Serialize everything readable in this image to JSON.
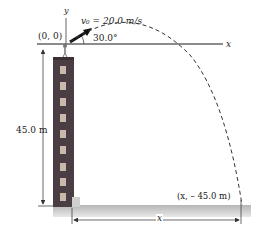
{
  "diagram": {
    "origin_label": "(0, 0)",
    "y_axis_label": "y",
    "x_axis_label": "x",
    "velocity_label": "v₀ = 20.0 m/s",
    "angle_label": "30.0°",
    "height_label": "45.0 m",
    "landing_label": "(x, – 45.0 m)",
    "distance_label": "x",
    "building_windows": 9,
    "colors": {
      "building": "#4a3e44",
      "window": "#c9b9a8",
      "ground": "#bdbdbd",
      "axis": "#555555",
      "trajectory": "#333333",
      "arrow": "#111111"
    }
  }
}
